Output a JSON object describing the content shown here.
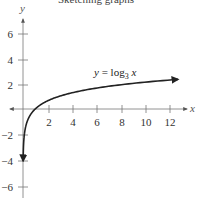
{
  "chart_data": {
    "type": "line",
    "title": "",
    "function": "y = log_3 x",
    "label": {
      "prefix": "y = log",
      "subscript": "3",
      "suffix": " x"
    },
    "xlabel": "x",
    "ylabel": "y",
    "xlim": [
      -1,
      13
    ],
    "ylim": [
      -7,
      7
    ],
    "x_ticks": [
      2,
      4,
      6,
      8,
      10,
      12
    ],
    "x_tick_labels": [
      "2",
      "4",
      "6",
      "8",
      "10",
      "12"
    ],
    "y_ticks": [
      -6,
      -4,
      -2,
      2,
      4,
      6
    ],
    "y_tick_labels": [
      "−6",
      "−4",
      "−2",
      "2",
      "4",
      "6"
    ],
    "grid": false,
    "legend": null,
    "series": [
      {
        "name": "y = log_3 x",
        "x": [
          0.05,
          0.1,
          0.2,
          0.33,
          0.5,
          1,
          2,
          3,
          4,
          6,
          8,
          9,
          10,
          12,
          12.7
        ],
        "y": [
          -2.73,
          -2.1,
          -1.46,
          -1.0,
          -0.63,
          0,
          0.63,
          1.0,
          1.26,
          1.63,
          1.89,
          2.0,
          2.1,
          2.26,
          2.31
        ]
      }
    ],
    "annotations": [
      "Arrowheads at both ends of curve (toward x=0+ going down, toward x≈12.7 going right)"
    ]
  },
  "ui": {
    "cropped_top_text": "Sketching graphs"
  }
}
